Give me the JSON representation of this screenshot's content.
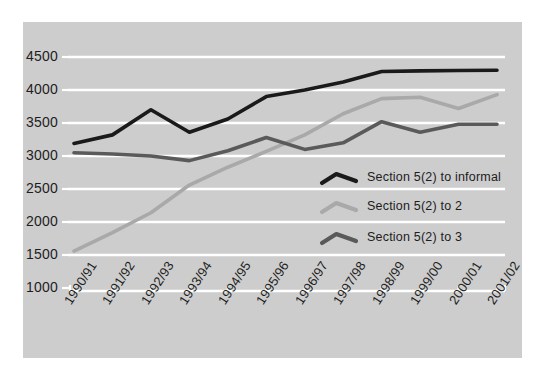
{
  "chart_data": {
    "type": "line",
    "title": "",
    "subtitle": "",
    "xlabel": "",
    "ylabel": "",
    "categories": [
      "1990/91",
      "1991/92",
      "1992/93",
      "1993/94",
      "1994/95",
      "1995/96",
      "1996/97",
      "1997/98",
      "1998/99",
      "1999/00",
      "2000/01",
      "2001/02"
    ],
    "ylim": [
      1000,
      4500
    ],
    "ytick_labels": [
      "1000",
      "1500",
      "2000",
      "2500",
      "3000",
      "3500",
      "4000",
      "4500"
    ],
    "ytick_values": [
      1000,
      1500,
      2000,
      2500,
      3000,
      3500,
      4000,
      4500
    ],
    "grid": "horizontal-only-white",
    "legend_position": "inside-right-middle",
    "series": [
      {
        "name": "Section 5(2) to informal",
        "color": "#1a1a1a",
        "values": [
          3190,
          3320,
          3700,
          3360,
          3560,
          3900,
          4000,
          4120,
          4280,
          4290,
          4295,
          4300
        ]
      },
      {
        "name": "Section 5(2) to 2",
        "color": "#a9a9a9",
        "values": [
          1560,
          1840,
          2140,
          2560,
          2830,
          3070,
          3320,
          3640,
          3870,
          3890,
          3720,
          3930
        ]
      },
      {
        "name": "Section 5(2) to 3",
        "color": "#5a5a5a",
        "values": [
          3050,
          3030,
          3000,
          2930,
          3080,
          3280,
          3100,
          3200,
          3520,
          3360,
          3480,
          3480
        ]
      }
    ]
  },
  "legend": {
    "entries": [
      {
        "label": "Section 5(2) to informal",
        "color": "#1a1a1a"
      },
      {
        "label": "Section 5(2) to 2",
        "color": "#a9a9a9"
      },
      {
        "label": "Section 5(2) to 3",
        "color": "#5a5a5a"
      }
    ]
  },
  "axes": {
    "y_ticks": [
      "4500",
      "4000",
      "3500",
      "3000",
      "2500",
      "2000",
      "1500",
      "1000"
    ],
    "x_ticks": [
      "1990/91",
      "1991/92",
      "1992/93",
      "1993/94",
      "1994/95",
      "1995/96",
      "1996/97",
      "1997/98",
      "1998/99",
      "1999/00",
      "2000/01",
      "2001/02"
    ]
  },
  "colors": {
    "panel_background": "#cdcdcd",
    "figure_background": "#ffffff",
    "gridline": "#ffffff",
    "axis": "#ffffff",
    "text": "#1d1d1d"
  }
}
